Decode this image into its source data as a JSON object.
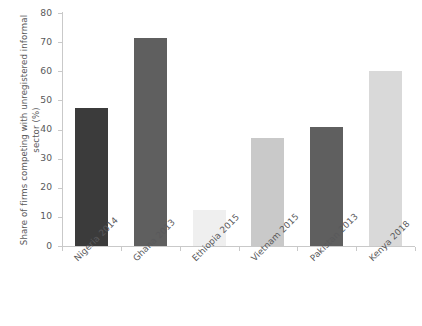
{
  "chart_data": {
    "type": "bar",
    "title": "",
    "xlabel": "",
    "ylabel": "Share of firms competing with unregistered informal sector (%)",
    "categories": [
      "Nigeria 2014",
      "Ghana 2013",
      "Ethiopia 2015",
      "Vietnam 2015",
      "Pakistan 2013",
      "Kenya 2018"
    ],
    "values": [
      47.5,
      71.5,
      12.5,
      37.0,
      41.0,
      60.0
    ],
    "bar_colors": [
      "#3b3b3b",
      "#5f5f5f",
      "#efefef",
      "#c9c9c9",
      "#5f5f5f",
      "#d9d9d9"
    ],
    "ylim": [
      0,
      80
    ],
    "yticks": [
      80,
      70,
      60,
      50,
      40,
      30,
      20,
      10,
      0
    ],
    "ytick_labels": [
      "80",
      "70",
      "60",
      "50",
      "40",
      "30",
      "20",
      "10",
      "0"
    ],
    "grid": false,
    "legend": "none",
    "axis_color": "#c9c9c9",
    "text_color": "#59595b",
    "background": "#ffffff"
  }
}
